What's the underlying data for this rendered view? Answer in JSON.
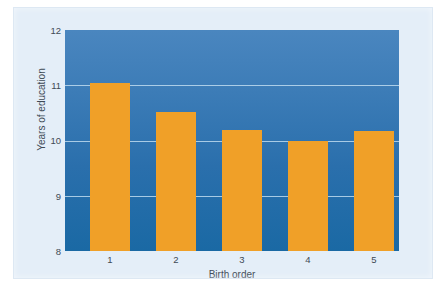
{
  "figure": {
    "background_color": "#ffffff",
    "panel_color": "#e4eef8"
  },
  "chart_data": {
    "type": "bar",
    "title": "",
    "subtitle": "",
    "xlabel": "Birth order",
    "ylabel": "Years of education",
    "categories": [
      "1",
      "2",
      "3",
      "4",
      "5"
    ],
    "values": [
      11.05,
      10.52,
      10.2,
      10.0,
      10.18
    ],
    "ylim": [
      8,
      12
    ],
    "yticks": [
      "12",
      "11",
      "10",
      "9",
      "8"
    ],
    "ytick_values": [
      12,
      11,
      10,
      9,
      8
    ],
    "xticks": [
      "1",
      "2",
      "3",
      "4",
      "5"
    ],
    "grid": true,
    "grid_axis": "y",
    "legend": false,
    "legend_position": "none",
    "bar_color": "#f0a028",
    "plot_background_top": "#4a86bf",
    "plot_background_bottom": "#1a69a4",
    "gridline_color": "#bedaee",
    "tick_label_color": "#3e4a55",
    "series": [
      {
        "name": "Years of education",
        "values": [
          11.05,
          10.52,
          10.2,
          10.0,
          10.18
        ]
      }
    ]
  }
}
